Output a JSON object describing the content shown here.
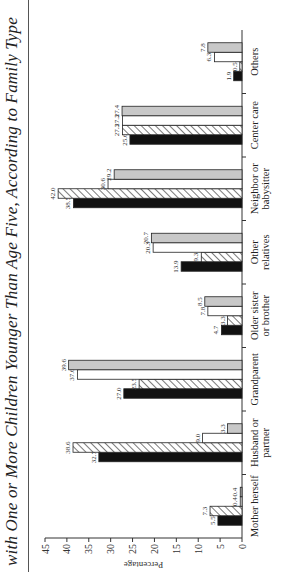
{
  "chart_data": {
    "type": "bar",
    "title": "with One or More Children Younger Than Age Five, According to Family Type",
    "xlabel": "",
    "ylabel": "Percentage",
    "ylim": [
      0,
      45
    ],
    "yticks": [
      0,
      5,
      10,
      15,
      20,
      25,
      30,
      35,
      40,
      45
    ],
    "categories": [
      "Mother herself",
      "Husband or partner",
      "Grandparent",
      "Older sister or brother",
      "Other relatives",
      "Neighbor or babysitter",
      "Center care",
      "Others"
    ],
    "series": [
      {
        "name": "Series 1 (black)",
        "fill": "#111111",
        "values": [
          5.5,
          32.7,
          27.0,
          4.7,
          13.9,
          38.5,
          25.6,
          1.9
        ]
      },
      {
        "name": "Series 2 (hatched)",
        "fill": "hatch",
        "values": [
          7.3,
          38.6,
          23.5,
          3.3,
          9.3,
          42.0,
          27.3,
          0.5
        ]
      },
      {
        "name": "Series 3 (white)",
        "fill": "#ffffff",
        "values": [
          0.4,
          9.0,
          37.6,
          7.8,
          20.3,
          30.6,
          27.3,
          6.3
        ]
      },
      {
        "name": "Series 4 (gray)",
        "fill": "#c8c8c8",
        "values": [
          0.4,
          3.3,
          39.6,
          8.5,
          20.7,
          29.2,
          27.4,
          7.8
        ]
      }
    ],
    "grid": false,
    "legend": "none visible",
    "orientation": "vertical bars, image rotated 90° counter-clockwise"
  }
}
